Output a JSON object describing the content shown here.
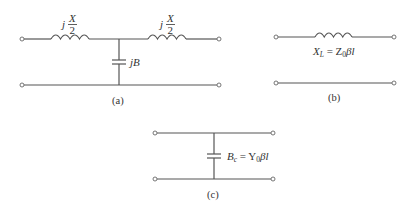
{
  "diagram": {
    "type": "transmission-line-equivalent-circuits",
    "colors": {
      "wire": "#555555",
      "text": "#333333",
      "background": "#ffffff"
    },
    "panels": [
      {
        "id": "a",
        "caption": "(a)",
        "series_left_label": {
          "j": "j",
          "num": "X",
          "den": "2"
        },
        "series_right_label": {
          "j": "j",
          "num": "X",
          "den": "2"
        },
        "shunt_label": "jB",
        "components": [
          "series-inductor",
          "shunt-capacitor",
          "series-inductor"
        ]
      },
      {
        "id": "b",
        "caption": "(b)",
        "series_label": {
          "sym": "X",
          "sub": "L",
          "eq": " = Z",
          "sub2": "0",
          "rest": "βl"
        },
        "components": [
          "series-inductor"
        ]
      },
      {
        "id": "c",
        "caption": "(c)",
        "shunt_label": {
          "sym": "B",
          "sub": "c",
          "eq": " = Y",
          "sub2": "0",
          "rest": "βl"
        },
        "components": [
          "shunt-capacitor"
        ]
      }
    ]
  }
}
